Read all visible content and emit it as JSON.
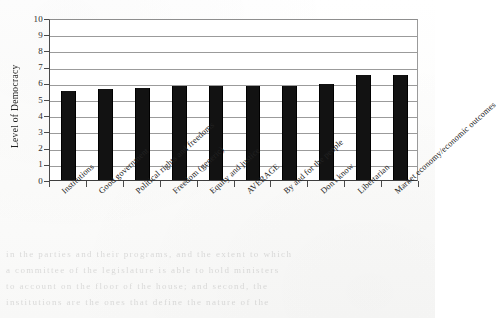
{
  "chart_data": {
    "type": "bar",
    "title": "",
    "subtitle": "",
    "xlabel": "",
    "ylabel": "Level of Democracy",
    "ylim": [
      0,
      10
    ],
    "yticks": [
      0,
      1,
      2,
      3,
      4,
      5,
      6,
      7,
      8,
      9,
      10
    ],
    "ytick_labels": [
      "0",
      "1",
      "2",
      "3",
      "4",
      "5",
      "6",
      "7",
      "8",
      "9",
      "10"
    ],
    "grid": true,
    "grid_axis": "y",
    "legend": false,
    "legend_position": "none",
    "bar_color": "#121212",
    "categories": [
      "Institutions",
      "Good government",
      "Political rights and freedoms",
      "Freedom (generic)",
      "Equity and justice",
      "AVERAGE",
      "By and for the people",
      "Don't know",
      "Libertarian",
      "Market economy/economic outcomes"
    ],
    "values": [
      5.5,
      5.6,
      5.7,
      5.8,
      5.8,
      5.8,
      5.8,
      5.9,
      6.5,
      6.5
    ],
    "annotations": []
  },
  "bleed_through": {
    "lines": [
      "in the parties and their programs, and the extent to which",
      "a committee of the legislature is able to hold ministers",
      "to account on the floor of the house; and second, the",
      "institutions are the ones that define the nature of the"
    ]
  }
}
